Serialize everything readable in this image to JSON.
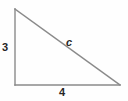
{
  "figure": {
    "name": "right-triangle-diagram",
    "background_color": "#fefefe",
    "stroke_color": "#8a8a8a",
    "label_color": "#262626",
    "stroke_width": 1.4,
    "vertices": {
      "apex": {
        "x": 15,
        "y": 9
      },
      "right_angle": {
        "x": 15,
        "y": 85
      },
      "base_right": {
        "x": 120,
        "y": 85
      }
    },
    "labels": {
      "vertical_leg": "3",
      "horizontal_leg": "4",
      "hypotenuse": "c"
    }
  },
  "chart_data": {
    "type": "diagram",
    "title": "",
    "shape": "right triangle",
    "sides": [
      {
        "name": "vertical leg",
        "label": "3",
        "value": 3,
        "orientation": "vertical"
      },
      {
        "name": "horizontal leg",
        "label": "4",
        "value": 4,
        "orientation": "horizontal"
      },
      {
        "name": "hypotenuse",
        "label": "c",
        "value": null,
        "orientation": "diagonal"
      }
    ]
  }
}
